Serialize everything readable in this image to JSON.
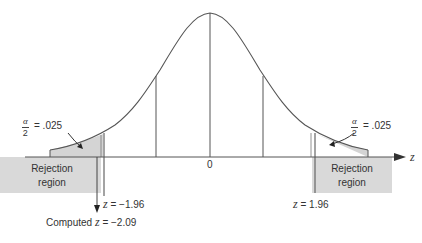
{
  "diagram": {
    "type": "two-tailed z-test normal distribution",
    "axis_label": "z",
    "center_label": "0",
    "left_tail": {
      "alpha_fraction": {
        "numerator": "α",
        "denominator": "2"
      },
      "alpha_value": "= .025",
      "region_line1": "Rejection",
      "region_line2": "region",
      "critical_label_var": "z",
      "critical_label_value": "= −1.96"
    },
    "right_tail": {
      "alpha_fraction": {
        "numerator": "α",
        "denominator": "2"
      },
      "alpha_value": "= .025",
      "region_line1": "Rejection",
      "region_line2": "region",
      "critical_label_var": "z",
      "critical_label_value": "= 1.96"
    },
    "computed": {
      "prefix": "Computed",
      "var": "z",
      "value": "= −2.09"
    },
    "colors": {
      "curve": "#555555",
      "shade": "#d4d4d4",
      "region_box": "#d9d9d9",
      "line": "#444444"
    }
  }
}
